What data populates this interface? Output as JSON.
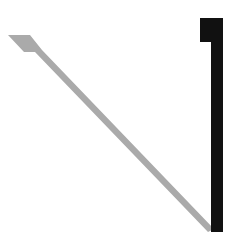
{
  "figure": {
    "background": "#ffffff",
    "shapes": {
      "diagonal_stroke": {
        "color": "#aaaaaa",
        "points": "8,35 30,35 42,50 214,229 208,232 35,52 24,52"
      },
      "vertical_bar": {
        "color": "#111111",
        "tab": {
          "x": 200,
          "y": 18,
          "w": 12,
          "h": 24
        },
        "stem": {
          "x": 211,
          "y": 18,
          "w": 12,
          "h": 214
        }
      }
    }
  }
}
